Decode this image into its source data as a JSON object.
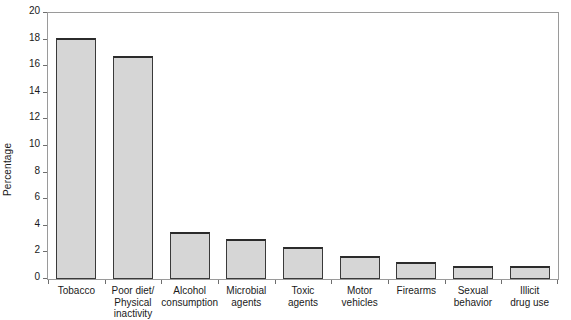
{
  "chart_data": {
    "type": "bar",
    "title": "",
    "subtitle": "",
    "xlabel": "",
    "ylabel": "Percentage",
    "ylim": [
      0,
      20
    ],
    "y_ticks": [
      0,
      2,
      4,
      6,
      8,
      10,
      12,
      14,
      16,
      18,
      20
    ],
    "grid": false,
    "legend": null,
    "categories": [
      "Tobacco",
      "Poor diet/\nPhysical\ninactivity",
      "Alcohol\nconsumption",
      "Microbial\nagents",
      "Toxic\nagents",
      "Motor\nvehicles",
      "Firearms",
      "Sexual\nbehavior",
      "Illicit\ndrug use"
    ],
    "values": [
      18.1,
      16.8,
      3.5,
      3.0,
      2.4,
      1.7,
      1.25,
      1.0,
      1.0
    ],
    "bar_fill_color": "#d6d6d6",
    "bar_border_color": "#3a3a3a",
    "frame_color": "#9a9a9a",
    "text_color": "#1a1a1a"
  }
}
